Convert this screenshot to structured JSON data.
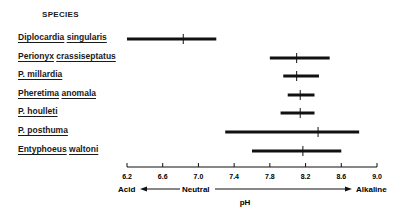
{
  "chart_data": {
    "type": "range",
    "title": "SPECIES",
    "xlabel": "pH",
    "xlim": [
      6.2,
      9.0
    ],
    "xticks": [
      "6.2",
      "6.6",
      "7.0",
      "7.4",
      "7.8",
      "8.2",
      "8.6",
      "9.0"
    ],
    "scale_annotations": {
      "left": "Acid",
      "center": "Neutral",
      "right": "Alkaline"
    },
    "series": [
      {
        "name": "Diplocardia singularis",
        "min": 6.2,
        "max": 7.2,
        "mean": 6.83
      },
      {
        "name": "Perionyx crassiseptatus",
        "min": 7.8,
        "max": 8.47,
        "mean": 8.1
      },
      {
        "name": "P. millardia",
        "min": 7.95,
        "max": 8.35,
        "mean": 8.1
      },
      {
        "name": "Pheretima anomala",
        "min": 8.0,
        "max": 8.3,
        "mean": 8.14
      },
      {
        "name": "P. houlleti",
        "min": 7.92,
        "max": 8.3,
        "mean": 8.14
      },
      {
        "name": "P. posthuma",
        "min": 7.3,
        "max": 8.8,
        "mean": 8.34
      },
      {
        "name": "Entyphoeus waltoni",
        "min": 7.6,
        "max": 8.6,
        "mean": 8.17
      }
    ],
    "grid": false
  },
  "labels": {
    "title": "SPECIES",
    "species": [
      [
        "Diplocardia",
        "singularis"
      ],
      [
        "Perionyx",
        "crassiseptatus"
      ],
      [
        "P. millardia"
      ],
      [
        "Pheretima",
        "anomala"
      ],
      [
        "P. houlleti"
      ],
      [
        "P. posthuma"
      ],
      [
        "Entyphoeus",
        "waltoni"
      ]
    ],
    "xlabel": "pH",
    "acid": "Acid",
    "neutral": "Neutral",
    "alkaline": "Alkaline"
  }
}
